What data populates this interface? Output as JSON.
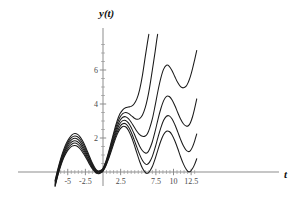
{
  "chart_data": {
    "type": "line",
    "title": "",
    "xlabel": "t",
    "ylabel": "y(t)",
    "xlim": [
      -6.8,
      13.3
    ],
    "ylim": [
      -0.85,
      7.9
    ],
    "grid": false,
    "legend": null,
    "x_ticks": [
      {
        "value": -5,
        "label": "-5"
      },
      {
        "value": -2.5,
        "label": "-2.5"
      },
      {
        "value": 2.5,
        "label": "2.5"
      },
      {
        "value": 7.5,
        "label": "7.5"
      },
      {
        "value": 10,
        "label": "10"
      },
      {
        "value": 12.5,
        "label": "12.5"
      }
    ],
    "y_ticks": [
      {
        "value": 2,
        "label": "2"
      },
      {
        "value": 4,
        "label": "4"
      },
      {
        "value": 6,
        "label": "6"
      }
    ],
    "x_minor_ticks": [
      -6,
      -5.5,
      -4.5,
      -4,
      -3.5,
      -3,
      -2,
      -1.5,
      -1,
      -0.5,
      0.5,
      1,
      1.5,
      2,
      3,
      3.5,
      4,
      4.5,
      5,
      5.5,
      6,
      6.5,
      7,
      8,
      8.5,
      9,
      9.5,
      10.5,
      11,
      11.5,
      12,
      13
    ],
    "y_minor_ticks": [
      0.5,
      1,
      1.5,
      2.5,
      3,
      3.5,
      4.5,
      5,
      5.5,
      6.5,
      7,
      7.5
    ],
    "series": [
      {
        "name": "curve-1",
        "points": [
          [
            -6.8,
            -0.85
          ],
          [
            -6.4,
            -0.2
          ],
          [
            -6.0,
            0.35
          ],
          [
            -5.6,
            0.8
          ],
          [
            -5.2,
            1.14
          ],
          [
            -4.8,
            1.38
          ],
          [
            -4.4,
            1.52
          ],
          [
            -4.0,
            1.56
          ],
          [
            -3.6,
            1.5
          ],
          [
            -3.2,
            1.34
          ],
          [
            -2.8,
            1.1
          ],
          [
            -2.4,
            0.82
          ],
          [
            -2.0,
            0.52
          ],
          [
            -1.6,
            0.24
          ],
          [
            -1.2,
            0.03
          ],
          [
            -0.9,
            -0.08
          ],
          [
            -0.6,
            -0.1
          ],
          [
            -0.3,
            -0.05
          ],
          [
            0.0,
            0.05
          ],
          [
            0.4,
            0.35
          ],
          [
            0.8,
            0.78
          ],
          [
            1.2,
            1.26
          ],
          [
            1.6,
            1.76
          ],
          [
            2.0,
            2.2
          ],
          [
            2.4,
            2.52
          ],
          [
            2.8,
            2.68
          ],
          [
            3.2,
            2.66
          ],
          [
            3.6,
            2.46
          ],
          [
            4.0,
            2.1
          ],
          [
            4.4,
            1.64
          ],
          [
            4.8,
            1.12
          ],
          [
            5.2,
            0.62
          ],
          [
            5.6,
            0.22
          ],
          [
            6.0,
            -0.02
          ],
          [
            6.3,
            -0.08
          ],
          [
            6.6,
            0.03
          ],
          [
            7.0,
            0.32
          ],
          [
            7.4,
            0.78
          ],
          [
            7.8,
            1.32
          ],
          [
            8.2,
            1.82
          ],
          [
            8.6,
            2.2
          ],
          [
            9.0,
            2.4
          ],
          [
            9.4,
            2.38
          ],
          [
            9.8,
            2.18
          ],
          [
            10.2,
            1.82
          ],
          [
            10.6,
            1.38
          ],
          [
            11.0,
            0.9
          ],
          [
            11.4,
            0.48
          ],
          [
            11.8,
            0.16
          ],
          [
            12.1,
            0.02
          ],
          [
            12.4,
            0.04
          ],
          [
            12.7,
            0.2
          ],
          [
            13.0,
            0.45
          ],
          [
            13.3,
            0.78
          ]
        ]
      },
      {
        "name": "curve-2",
        "points": [
          [
            -6.8,
            -0.8
          ],
          [
            -6.4,
            -0.15
          ],
          [
            -6.0,
            0.42
          ],
          [
            -5.6,
            0.88
          ],
          [
            -5.2,
            1.24
          ],
          [
            -4.8,
            1.5
          ],
          [
            -4.4,
            1.65
          ],
          [
            -4.0,
            1.7
          ],
          [
            -3.6,
            1.64
          ],
          [
            -3.2,
            1.47
          ],
          [
            -2.8,
            1.22
          ],
          [
            -2.4,
            0.92
          ],
          [
            -2.0,
            0.6
          ],
          [
            -1.6,
            0.3
          ],
          [
            -1.2,
            0.07
          ],
          [
            -0.9,
            -0.04
          ],
          [
            -0.6,
            -0.07
          ],
          [
            -0.3,
            -0.02
          ],
          [
            0.0,
            0.08
          ],
          [
            0.4,
            0.4
          ],
          [
            0.8,
            0.85
          ],
          [
            1.2,
            1.36
          ],
          [
            1.6,
            1.88
          ],
          [
            2.0,
            2.34
          ],
          [
            2.4,
            2.68
          ],
          [
            2.8,
            2.84
          ],
          [
            3.2,
            2.84
          ],
          [
            3.6,
            2.66
          ],
          [
            4.0,
            2.34
          ],
          [
            4.4,
            1.92
          ],
          [
            4.8,
            1.46
          ],
          [
            5.2,
            1.02
          ],
          [
            5.6,
            0.68
          ],
          [
            6.0,
            0.48
          ],
          [
            6.3,
            0.45
          ],
          [
            6.6,
            0.58
          ],
          [
            7.0,
            0.92
          ],
          [
            7.4,
            1.44
          ],
          [
            7.8,
            2.04
          ],
          [
            8.2,
            2.6
          ],
          [
            8.6,
            3.04
          ],
          [
            9.0,
            3.28
          ],
          [
            9.4,
            3.3
          ],
          [
            9.8,
            3.12
          ],
          [
            10.2,
            2.78
          ],
          [
            10.6,
            2.36
          ],
          [
            11.0,
            1.92
          ],
          [
            11.4,
            1.54
          ],
          [
            11.8,
            1.28
          ],
          [
            12.1,
            1.2
          ],
          [
            12.4,
            1.26
          ],
          [
            12.7,
            1.48
          ],
          [
            13.0,
            1.82
          ],
          [
            13.3,
            2.24
          ]
        ]
      },
      {
        "name": "curve-3",
        "points": [
          [
            -6.8,
            -0.74
          ],
          [
            -6.4,
            -0.08
          ],
          [
            -6.0,
            0.5
          ],
          [
            -5.6,
            0.97
          ],
          [
            -5.2,
            1.35
          ],
          [
            -4.8,
            1.62
          ],
          [
            -4.4,
            1.78
          ],
          [
            -4.0,
            1.84
          ],
          [
            -3.6,
            1.78
          ],
          [
            -3.2,
            1.61
          ],
          [
            -2.8,
            1.35
          ],
          [
            -2.4,
            1.03
          ],
          [
            -2.0,
            0.69
          ],
          [
            -1.6,
            0.37
          ],
          [
            -1.2,
            0.12
          ],
          [
            -0.9,
            -0.01
          ],
          [
            -0.6,
            -0.04
          ],
          [
            -0.3,
            0.01
          ],
          [
            0.0,
            0.11
          ],
          [
            0.4,
            0.45
          ],
          [
            0.8,
            0.93
          ],
          [
            1.2,
            1.47
          ],
          [
            1.6,
            2.01
          ],
          [
            2.0,
            2.5
          ],
          [
            2.4,
            2.85
          ],
          [
            2.8,
            3.02
          ],
          [
            3.2,
            3.03
          ],
          [
            3.6,
            2.89
          ],
          [
            4.0,
            2.62
          ],
          [
            4.4,
            2.26
          ],
          [
            4.8,
            1.88
          ],
          [
            5.2,
            1.52
          ],
          [
            5.6,
            1.25
          ],
          [
            6.0,
            1.12
          ],
          [
            6.3,
            1.14
          ],
          [
            6.6,
            1.34
          ],
          [
            7.0,
            1.78
          ],
          [
            7.4,
            2.4
          ],
          [
            7.8,
            3.1
          ],
          [
            8.2,
            3.72
          ],
          [
            8.6,
            4.2
          ],
          [
            9.0,
            4.45
          ],
          [
            9.4,
            4.44
          ],
          [
            9.8,
            4.24
          ],
          [
            10.2,
            3.9
          ],
          [
            10.6,
            3.5
          ],
          [
            11.0,
            3.12
          ],
          [
            11.4,
            2.84
          ],
          [
            11.8,
            2.7
          ],
          [
            12.1,
            2.72
          ],
          [
            12.4,
            2.9
          ],
          [
            12.7,
            3.25
          ],
          [
            13.0,
            3.74
          ],
          [
            13.3,
            4.3
          ]
        ]
      },
      {
        "name": "curve-4",
        "points": [
          [
            -6.8,
            -0.66
          ],
          [
            -6.4,
            0.0
          ],
          [
            -6.0,
            0.59
          ],
          [
            -5.6,
            1.07
          ],
          [
            -5.2,
            1.46
          ],
          [
            -4.8,
            1.74
          ],
          [
            -4.4,
            1.92
          ],
          [
            -4.0,
            1.98
          ],
          [
            -3.6,
            1.93
          ],
          [
            -3.2,
            1.76
          ],
          [
            -2.8,
            1.49
          ],
          [
            -2.4,
            1.15
          ],
          [
            -2.0,
            0.79
          ],
          [
            -1.6,
            0.44
          ],
          [
            -1.2,
            0.17
          ],
          [
            -0.9,
            0.03
          ],
          [
            -0.6,
            0.0
          ],
          [
            -0.3,
            0.04
          ],
          [
            0.0,
            0.14
          ],
          [
            0.4,
            0.5
          ],
          [
            0.8,
            1.01
          ],
          [
            1.2,
            1.58
          ],
          [
            1.6,
            2.15
          ],
          [
            2.0,
            2.66
          ],
          [
            2.4,
            3.03
          ],
          [
            2.8,
            3.22
          ],
          [
            3.2,
            3.25
          ],
          [
            3.6,
            3.14
          ],
          [
            4.0,
            2.93
          ],
          [
            4.4,
            2.66
          ],
          [
            4.8,
            2.4
          ],
          [
            5.2,
            2.2
          ],
          [
            5.6,
            2.1
          ],
          [
            6.0,
            2.12
          ],
          [
            6.3,
            2.25
          ],
          [
            6.6,
            2.55
          ],
          [
            7.0,
            3.12
          ],
          [
            7.4,
            3.92
          ],
          [
            7.8,
            4.78
          ],
          [
            8.2,
            5.52
          ],
          [
            8.6,
            6.05
          ],
          [
            9.0,
            6.28
          ],
          [
            9.4,
            6.22
          ],
          [
            9.8,
            5.96
          ],
          [
            10.2,
            5.6
          ],
          [
            10.6,
            5.26
          ],
          [
            11.0,
            5.02
          ],
          [
            11.4,
            4.95
          ],
          [
            11.8,
            5.05
          ],
          [
            12.1,
            5.28
          ],
          [
            12.4,
            5.62
          ],
          [
            12.7,
            6.08
          ],
          [
            13.0,
            6.6
          ],
          [
            13.3,
            7.15
          ]
        ]
      },
      {
        "name": "curve-5",
        "points": [
          [
            -6.8,
            -0.58
          ],
          [
            -6.4,
            0.09
          ],
          [
            -6.0,
            0.69
          ],
          [
            -5.6,
            1.18
          ],
          [
            -5.2,
            1.57
          ],
          [
            -4.8,
            1.86
          ],
          [
            -4.4,
            2.05
          ],
          [
            -4.0,
            2.12
          ],
          [
            -3.6,
            2.07
          ],
          [
            -3.2,
            1.9
          ],
          [
            -2.8,
            1.63
          ],
          [
            -2.4,
            1.28
          ],
          [
            -2.0,
            0.9
          ],
          [
            -1.6,
            0.52
          ],
          [
            -1.2,
            0.22
          ],
          [
            -0.9,
            0.07
          ],
          [
            -0.6,
            0.03
          ],
          [
            -0.3,
            0.07
          ],
          [
            0.0,
            0.18
          ],
          [
            0.4,
            0.56
          ],
          [
            0.8,
            1.1
          ],
          [
            1.2,
            1.7
          ],
          [
            1.6,
            2.3
          ],
          [
            2.0,
            2.83
          ],
          [
            2.4,
            3.22
          ],
          [
            2.8,
            3.43
          ],
          [
            3.2,
            3.5
          ],
          [
            3.6,
            3.45
          ],
          [
            4.0,
            3.32
          ],
          [
            4.4,
            3.18
          ],
          [
            4.8,
            3.1
          ],
          [
            5.2,
            3.14
          ],
          [
            5.6,
            3.35
          ],
          [
            6.0,
            3.8
          ],
          [
            6.3,
            4.3
          ],
          [
            6.6,
            4.95
          ],
          [
            7.0,
            6.0
          ],
          [
            7.4,
            7.1
          ],
          [
            7.6,
            7.7
          ],
          [
            7.75,
            8.1
          ]
        ]
      },
      {
        "name": "curve-6",
        "points": [
          [
            -6.8,
            -0.5
          ],
          [
            -6.4,
            0.18
          ],
          [
            -6.0,
            0.79
          ],
          [
            -5.6,
            1.29
          ],
          [
            -5.2,
            1.69
          ],
          [
            -4.8,
            1.98
          ],
          [
            -4.4,
            2.18
          ],
          [
            -4.0,
            2.26
          ],
          [
            -3.6,
            2.21
          ],
          [
            -3.2,
            2.04
          ],
          [
            -2.8,
            1.76
          ],
          [
            -2.4,
            1.4
          ],
          [
            -2.0,
            1.0
          ],
          [
            -1.6,
            0.6
          ],
          [
            -1.2,
            0.28
          ],
          [
            -0.9,
            0.11
          ],
          [
            -0.6,
            0.06
          ],
          [
            -0.3,
            0.1
          ],
          [
            0.0,
            0.22
          ],
          [
            0.4,
            0.62
          ],
          [
            0.8,
            1.18
          ],
          [
            1.2,
            1.81
          ],
          [
            1.6,
            2.44
          ],
          [
            2.0,
            3.0
          ],
          [
            2.4,
            3.42
          ],
          [
            2.8,
            3.66
          ],
          [
            3.2,
            3.78
          ],
          [
            3.6,
            3.82
          ],
          [
            4.0,
            3.86
          ],
          [
            4.4,
            4.0
          ],
          [
            4.8,
            4.3
          ],
          [
            5.2,
            4.85
          ],
          [
            5.6,
            5.7
          ],
          [
            6.0,
            6.8
          ],
          [
            6.3,
            7.6
          ],
          [
            6.5,
            8.1
          ]
        ]
      }
    ]
  }
}
